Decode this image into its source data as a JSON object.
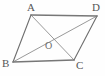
{
  "figure": {
    "name": "parallelogram-abcd-with-diagonals",
    "background_color": "#fefefe",
    "stroke_color_sides": "#6e6e6e",
    "stroke_color_edges_strong": "#777777",
    "stroke_color_diagonals": "#8a8a8a",
    "label_color": "#565656",
    "label_color_center": "#6a6a6a",
    "width": 105,
    "height": 76
  },
  "labels": {
    "a": "A",
    "b": "B",
    "c": "C",
    "d": "D",
    "o": "O"
  },
  "vertices": {
    "a": {
      "x": 31,
      "y": 15
    },
    "b": {
      "x": 13,
      "y": 62
    },
    "c": {
      "x": 74,
      "y": 60
    },
    "d": {
      "x": 97,
      "y": 16
    },
    "o": {
      "x": 52,
      "y": 37
    }
  },
  "label_positions": {
    "a": {
      "x": 27,
      "y": 2
    },
    "b": {
      "x": 2,
      "y": 58
    },
    "c": {
      "x": 76,
      "y": 60
    },
    "d": {
      "x": 92,
      "y": 2
    },
    "o": {
      "x": 45,
      "y": 41
    }
  },
  "segments": [
    {
      "name": "side-ad",
      "from": "a",
      "to": "d",
      "role": "side"
    },
    {
      "name": "side-ab",
      "from": "a",
      "to": "b",
      "role": "side"
    },
    {
      "name": "side-bc",
      "from": "b",
      "to": "c",
      "role": "side"
    },
    {
      "name": "side-cd",
      "from": "c",
      "to": "d",
      "role": "side"
    },
    {
      "name": "diagonal-ac",
      "from": "a",
      "to": "c",
      "role": "diagonal"
    },
    {
      "name": "diagonal-bd",
      "from": "b",
      "to": "d",
      "role": "diagonal"
    }
  ]
}
